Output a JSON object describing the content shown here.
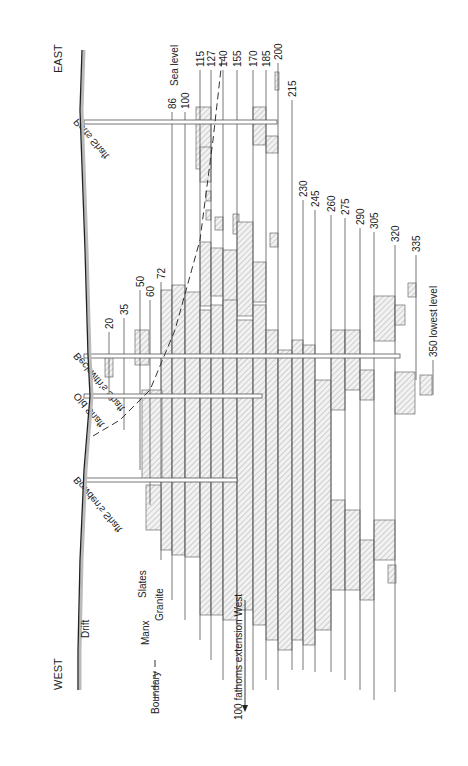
{
  "diagram": {
    "orientation": "rotated 90 degrees clockwise; surface at left, depth increases to the right; EAST at top, WEST at bottom",
    "directions": {
      "east": "EAST",
      "west": "WEST"
    },
    "surface_label": "Drift",
    "sea_level_label": "Sea level",
    "boundary_labels": {
      "boundary": "Boundary",
      "manx": "Manx",
      "slates": "Slates",
      "granite": "Granite"
    },
    "extension_label": "100 fathoms extension West",
    "shafts": [
      {
        "name": "Potts Shaft",
        "y": 122,
        "x_end": 277
      },
      {
        "name": "Beckwith's Shaft",
        "y": 356,
        "x_end": 400
      },
      {
        "name": "Old Shaft",
        "y": 396,
        "x_end": 262
      },
      {
        "name": "Bowden's Shaft",
        "y": 480,
        "x_end": 237
      }
    ],
    "levels": [
      {
        "label": "20",
        "x": 109,
        "y_top": 332,
        "y_bot": 400
      },
      {
        "label": "35",
        "x": 124,
        "y_top": 318,
        "y_bot": 430
      },
      {
        "label": "50",
        "x": 140,
        "y_top": 290,
        "y_bot": 470
      },
      {
        "label": "60",
        "x": 150,
        "y_top": 300,
        "y_bot": 505
      },
      {
        "label": "72",
        "x": 161,
        "y_top": 282,
        "y_bot": 560
      },
      {
        "label": "86",
        "x": 172,
        "y_top": 112,
        "y_bot": 600
      },
      {
        "label": "100",
        "x": 185,
        "y_top": 112,
        "y_bot": 620
      },
      {
        "label": "115",
        "x": 200,
        "y_top": 70,
        "y_bot": 640
      },
      {
        "label": "127",
        "x": 211,
        "y_top": 70,
        "y_bot": 660
      },
      {
        "label": "140",
        "x": 223,
        "y_top": 70,
        "y_bot": 680
      },
      {
        "label": "155",
        "x": 237,
        "y_top": 70,
        "y_bot": 690
      },
      {
        "label": "170",
        "x": 253,
        "y_top": 70,
        "y_bot": 690
      },
      {
        "label": "185",
        "x": 266,
        "y_top": 70,
        "y_bot": 680
      },
      {
        "label": "200",
        "x": 278,
        "y_top": 63,
        "y_bot": 690
      },
      {
        "label": "215",
        "x": 292,
        "y_top": 100,
        "y_bot": 670
      },
      {
        "label": "230",
        "x": 303,
        "y_top": 200,
        "y_bot": 670
      },
      {
        "label": "245",
        "x": 315,
        "y_top": 210,
        "y_bot": 672
      },
      {
        "label": "260",
        "x": 331,
        "y_top": 215,
        "y_bot": 672
      },
      {
        "label": "275",
        "x": 345,
        "y_top": 218,
        "y_bot": 680
      },
      {
        "label": "290",
        "x": 360,
        "y_top": 228,
        "y_bot": 690
      },
      {
        "label": "305",
        "x": 374,
        "y_top": 232,
        "y_bot": 700
      },
      {
        "label": "320",
        "x": 395,
        "y_top": 245,
        "y_bot": 692
      },
      {
        "label": "335",
        "x": 416,
        "y_top": 255,
        "y_bot": 380
      },
      {
        "label": "350 lowest level",
        "x": 433,
        "y_top": 360,
        "y_bot": 395
      }
    ],
    "ore_bodies": [
      {
        "x": 196,
        "y": 107,
        "w": 15,
        "h": 62
      },
      {
        "x": 200,
        "y": 147,
        "w": 11,
        "h": 35
      },
      {
        "x": 253,
        "y": 107,
        "w": 13,
        "h": 38
      },
      {
        "x": 266,
        "y": 136,
        "w": 12,
        "h": 17
      },
      {
        "x": 275,
        "y": 72,
        "w": 4,
        "h": 18
      },
      {
        "x": 206,
        "y": 191,
        "w": 5,
        "h": 10
      },
      {
        "x": 206,
        "y": 210,
        "w": 5,
        "h": 10
      },
      {
        "x": 215,
        "y": 217,
        "w": 8,
        "h": 13
      },
      {
        "x": 233,
        "y": 214,
        "w": 6,
        "h": 20
      },
      {
        "x": 200,
        "y": 242,
        "w": 11,
        "h": 64
      },
      {
        "x": 211,
        "y": 248,
        "w": 12,
        "h": 48
      },
      {
        "x": 223,
        "y": 250,
        "w": 14,
        "h": 54
      },
      {
        "x": 237,
        "y": 222,
        "w": 16,
        "h": 94
      },
      {
        "x": 253,
        "y": 262,
        "w": 13,
        "h": 40
      },
      {
        "x": 270,
        "y": 233,
        "w": 8,
        "h": 14
      },
      {
        "x": 161,
        "y": 290,
        "w": 11,
        "h": 260
      },
      {
        "x": 172,
        "y": 285,
        "w": 13,
        "h": 270
      },
      {
        "x": 185,
        "y": 292,
        "w": 15,
        "h": 265
      },
      {
        "x": 200,
        "y": 310,
        "w": 11,
        "h": 305
      },
      {
        "x": 211,
        "y": 305,
        "w": 12,
        "h": 310
      },
      {
        "x": 223,
        "y": 300,
        "w": 14,
        "h": 320
      },
      {
        "x": 237,
        "y": 320,
        "w": 16,
        "h": 290
      },
      {
        "x": 253,
        "y": 305,
        "w": 13,
        "h": 320
      },
      {
        "x": 266,
        "y": 330,
        "w": 12,
        "h": 310
      },
      {
        "x": 278,
        "y": 350,
        "w": 14,
        "h": 300
      },
      {
        "x": 292,
        "y": 340,
        "w": 11,
        "h": 300
      },
      {
        "x": 303,
        "y": 345,
        "w": 12,
        "h": 300
      },
      {
        "x": 315,
        "y": 380,
        "w": 16,
        "h": 250
      },
      {
        "x": 331,
        "y": 330,
        "w": 14,
        "h": 80
      },
      {
        "x": 345,
        "y": 330,
        "w": 15,
        "h": 60
      },
      {
        "x": 360,
        "y": 370,
        "w": 14,
        "h": 30
      },
      {
        "x": 374,
        "y": 296,
        "w": 21,
        "h": 45
      },
      {
        "x": 395,
        "y": 305,
        "w": 10,
        "h": 20
      },
      {
        "x": 395,
        "y": 372,
        "w": 20,
        "h": 42
      },
      {
        "x": 408,
        "y": 283,
        "w": 8,
        "h": 14
      },
      {
        "x": 420,
        "y": 375,
        "w": 12,
        "h": 20
      },
      {
        "x": 331,
        "y": 500,
        "w": 14,
        "h": 90
      },
      {
        "x": 345,
        "y": 510,
        "w": 15,
        "h": 80
      },
      {
        "x": 360,
        "y": 540,
        "w": 14,
        "h": 60
      },
      {
        "x": 374,
        "y": 520,
        "w": 21,
        "h": 40
      },
      {
        "x": 388,
        "y": 565,
        "w": 8,
        "h": 18
      },
      {
        "x": 135,
        "y": 330,
        "w": 14,
        "h": 35
      },
      {
        "x": 105,
        "y": 357,
        "w": 8,
        "h": 20
      },
      {
        "x": 142,
        "y": 390,
        "w": 20,
        "h": 90
      },
      {
        "x": 146,
        "y": 485,
        "w": 15,
        "h": 45
      }
    ],
    "rock_boundary": [
      [
        93,
        436
      ],
      [
        120,
        420
      ],
      [
        150,
        390
      ],
      [
        175,
        330
      ],
      [
        200,
        240
      ],
      [
        213,
        140
      ],
      [
        222,
        60
      ]
    ],
    "surface_curve": [
      [
        82,
        50
      ],
      [
        80,
        110
      ],
      [
        85,
        250
      ],
      [
        88,
        355
      ],
      [
        90,
        396
      ],
      [
        84,
        470
      ],
      [
        80,
        560
      ],
      [
        78,
        650
      ],
      [
        78,
        690
      ]
    ]
  }
}
